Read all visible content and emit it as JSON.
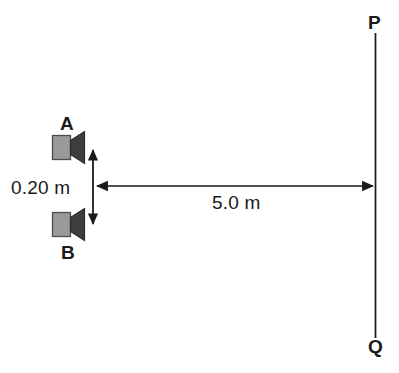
{
  "diagram": {
    "background_color": "#ffffff",
    "stroke_color": "#1a1a1a",
    "speaker_body_color": "#9a9a9a",
    "speaker_horn_color": "#3a3a3a",
    "labels": {
      "speaker_a": "A",
      "speaker_b": "B",
      "line_top": "P",
      "line_bottom": "Q",
      "separation": "0.20 m",
      "distance": "5.0 m"
    }
  }
}
